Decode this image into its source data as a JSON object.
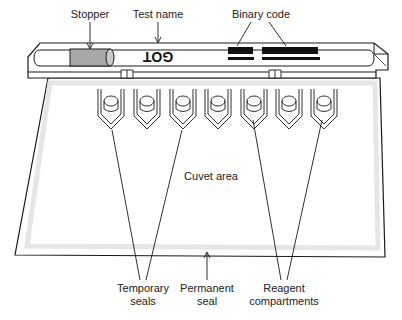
{
  "diagram": {
    "labels": {
      "stopper": "Stopper",
      "test_name": "Test name",
      "binary_code": "Binary code",
      "cuvet_area": "Cuvet area",
      "temporary_seals_line1": "Temporary",
      "temporary_seals_line2": "seals",
      "permanent_seal_line1": "Permanent",
      "permanent_seal_line2": "seal",
      "reagent_compartments_line1": "Reagent",
      "reagent_compartments_line2": "compartments"
    },
    "test_name_printed": "GOT",
    "compartment_count": 7,
    "colors": {
      "line": "#1a1a1a",
      "stopper_fill": "#a8a8a8",
      "binary_code": "#111111",
      "seal_shadow": "#e6e6e6"
    }
  }
}
